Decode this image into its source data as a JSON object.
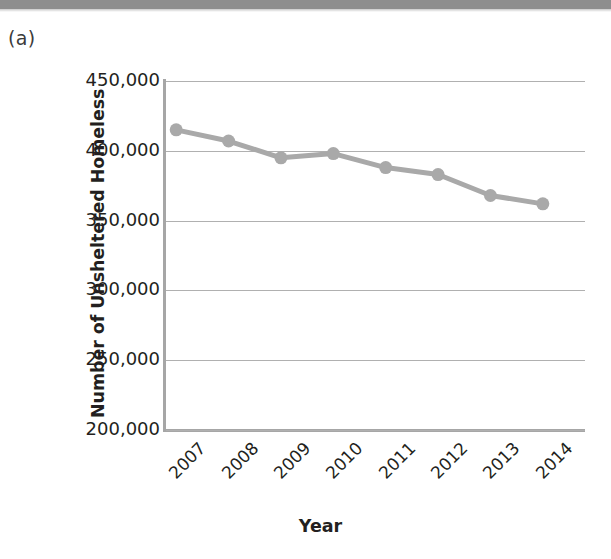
{
  "panel": {
    "label": "(a)"
  },
  "colors": {
    "series_line": "#a9a9a9",
    "series_marker": "#a9a9a9",
    "gridline": "#b0b0b0",
    "axis": "#a6a6a6",
    "text": "#231f20",
    "top_bar": "#8e8e8e"
  },
  "chart_data": {
    "type": "line",
    "title": "",
    "xlabel": "Year",
    "ylabel": "Number of Unsheltered Homeless",
    "categories": [
      "2007",
      "2008",
      "2009",
      "2010",
      "2011",
      "2012",
      "2013",
      "2014"
    ],
    "values": [
      415000,
      407000,
      395000,
      398000,
      388000,
      383000,
      368000,
      362000
    ],
    "ylim": [
      200000,
      450000
    ],
    "yticks": [
      200000,
      250000,
      300000,
      350000,
      400000,
      450000
    ],
    "ytick_labels": [
      "200,000",
      "250,000",
      "300,000",
      "350,000",
      "400,000",
      "450,000"
    ],
    "grid": true,
    "legend": false,
    "marker": "circle",
    "series": [
      {
        "name": "Unsheltered Homeless",
        "values": [
          415000,
          407000,
          395000,
          398000,
          388000,
          383000,
          368000,
          362000
        ]
      }
    ]
  }
}
